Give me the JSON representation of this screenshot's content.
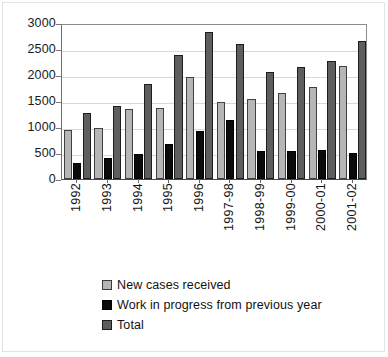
{
  "chart_data": {
    "type": "bar",
    "title": "",
    "xlabel": "",
    "ylabel": "",
    "ylim": [
      0,
      3000
    ],
    "ytick_values": [
      3000,
      2500,
      2000,
      1500,
      1000,
      500,
      0
    ],
    "ytick_labels": [
      "3000",
      "2500",
      "2000",
      "1500",
      "1000",
      "500",
      "0"
    ],
    "grid": true,
    "legend_position": "bottom",
    "categories": [
      "1992",
      "1993",
      "1994",
      "1995",
      "1996",
      "1997-98",
      "1998-99",
      "1999-00",
      "2000-01",
      "2001-02"
    ],
    "series": [
      {
        "name": "New cases received",
        "color": "#b6b6b6",
        "values": [
          950,
          990,
          1340,
          1360,
          1960,
          1490,
          1540,
          1660,
          1770,
          2180
        ]
      },
      {
        "name": "Work in progress from previous year",
        "color": "#0b0b0b",
        "values": [
          310,
          410,
          480,
          680,
          930,
          1130,
          530,
          530,
          560,
          500
        ]
      },
      {
        "name": "Total",
        "color": "#5e5e5e",
        "values": [
          1260,
          1400,
          1820,
          2380,
          2830,
          2600,
          2050,
          2150,
          2270,
          2660
        ]
      }
    ]
  },
  "legend": {
    "items": [
      {
        "label": "New cases received",
        "swatch": "sw-new"
      },
      {
        "label": "Work in progress from previous year",
        "swatch": "sw-wip"
      },
      {
        "label": "Total",
        "swatch": "sw-total"
      }
    ]
  }
}
